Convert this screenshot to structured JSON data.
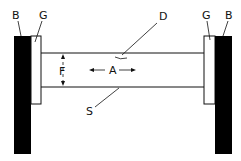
{
  "diagram": {
    "labels": {
      "b_left": "B",
      "g_left": "G",
      "d": "D",
      "g_right": "G",
      "b_right": "B",
      "f": "F",
      "a": "A",
      "s": "S"
    },
    "colors": {
      "block_fill": "#000000",
      "line": "#111111",
      "background": "#ffffff"
    }
  }
}
